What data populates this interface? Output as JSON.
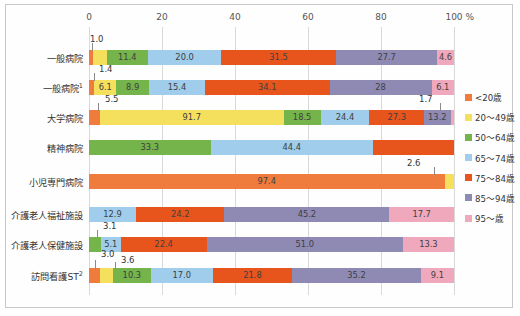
{
  "chart_data": {
    "type": "bar",
    "orientation": "horizontal",
    "stacked": true,
    "title": "",
    "xlabel": "%",
    "ylabel": "",
    "xlim": [
      0,
      100
    ],
    "xticks": [
      0,
      20,
      40,
      60,
      80,
      100
    ],
    "xtick_labels": [
      "0",
      "20",
      "40",
      "60",
      "80",
      "100"
    ],
    "x_axis_unit": "%",
    "grid": true,
    "legend_position": "right",
    "categories": [
      "一般病院",
      "一般病院",
      "大学病院",
      "精神病院",
      "小児専門病院",
      "介護老人福祉施設",
      "介護老人保健施設",
      "訪問看護ST"
    ],
    "category_footnotes": [
      "",
      "1",
      "",
      "",
      "",
      "",
      "",
      "2"
    ],
    "series": [
      {
        "name": "<20歳",
        "color": "#ef7c3c",
        "values": [
          1.0,
          1.4,
          5.5,
          0,
          97.4,
          0,
          0,
          3.0
        ]
      },
      {
        "name": "20～49歳",
        "color": "#f5e05e",
        "values": [
          3.8,
          6.1,
          91.7,
          0,
          2.6,
          0,
          0,
          3.6
        ]
      },
      {
        "name": "50～64歳",
        "color": "#74b44a",
        "values": [
          11.4,
          8.9,
          18.5,
          33.3,
          0,
          0,
          3.1,
          10.3
        ]
      },
      {
        "name": "65～74歳",
        "color": "#9fcdeb",
        "values": [
          20.0,
          15.4,
          24.4,
          44.4,
          0,
          12.9,
          5.1,
          17.0
        ]
      },
      {
        "name": "75～84歳",
        "color": "#e8551c",
        "values": [
          31.5,
          34.1,
          27.3,
          22.2,
          0,
          24.2,
          22.4,
          21.8
        ]
      },
      {
        "name": "85～94歳",
        "color": "#8e8ab4",
        "values": [
          27.7,
          28.0,
          13.2,
          0,
          0,
          45.2,
          51.0,
          35.2
        ]
      },
      {
        "name": "95～歳",
        "color": "#f0a8bd",
        "values": [
          4.6,
          6.1,
          1.7,
          0,
          0,
          17.7,
          13.3,
          9.1
        ]
      }
    ],
    "bar_labels": [
      [
        "1.0",
        "3.8",
        "11.4",
        "20.0",
        "31.5",
        "27.7",
        "4.6"
      ],
      [
        "1.4",
        "6.1",
        "8.9",
        "15.4",
        "34.1",
        "28",
        "6.1"
      ],
      [
        "5.5",
        "91.7",
        "18.5",
        "24.4",
        "27.3",
        "13.2",
        "1.7"
      ],
      [
        "",
        "",
        "33.3",
        "44.4",
        "",
        "",
        ""
      ],
      [
        "97.4",
        "2.6",
        "",
        "",
        "",
        "",
        ""
      ],
      [
        "",
        "",
        "",
        "12.9",
        "24.2",
        "45.2",
        "17.7"
      ],
      [
        "",
        "",
        "3.1",
        "5.1",
        "22.4",
        "51.0",
        "13.3"
      ],
      [
        "3.0",
        "3.6",
        "10.3",
        "17.0",
        "21.8",
        "35.2",
        "9.1"
      ]
    ],
    "callouts": [
      {
        "row": 0,
        "text": "1.0"
      },
      {
        "row": 1,
        "text": "1.4"
      },
      {
        "row": 2,
        "text": "5.5"
      },
      {
        "row": 2,
        "text": "1.7"
      },
      {
        "row": 4,
        "text": "2.6"
      },
      {
        "row": 6,
        "text": "3.1"
      },
      {
        "row": 7,
        "text": "3.0"
      },
      {
        "row": 7,
        "text": "3.6"
      }
    ],
    "legend": [
      {
        "label": "<20歳",
        "color": "#ef7c3c"
      },
      {
        "label": "20～49歳",
        "color": "#f5e05e"
      },
      {
        "label": "50～64歳",
        "color": "#74b44a"
      },
      {
        "label": "65～74歳",
        "color": "#9fcdeb"
      },
      {
        "label": "75～84歳",
        "color": "#e8551c"
      },
      {
        "label": "85～94歳",
        "color": "#8e8ab4"
      },
      {
        "label": "95～歳",
        "color": "#f0a8bd"
      }
    ]
  }
}
